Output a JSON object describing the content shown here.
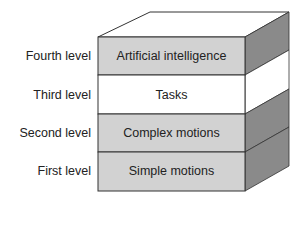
{
  "diagram": {
    "levels": [
      {
        "level": "Fourth level",
        "name": "Artificial intelligence",
        "shaded": true
      },
      {
        "level": "Third level",
        "name": "Tasks",
        "shaded": false
      },
      {
        "level": "Second level",
        "name": "Complex motions",
        "shaded": true
      },
      {
        "level": "First level",
        "name": "Simple motions",
        "shaded": true
      }
    ],
    "colors": {
      "front_shaded": "#d2d2d2",
      "front_white": "#ffffff",
      "side_shaded": "#8a8a8a",
      "side_white": "#ffffff",
      "top": "#ffffff",
      "stroke": "#333333"
    }
  }
}
